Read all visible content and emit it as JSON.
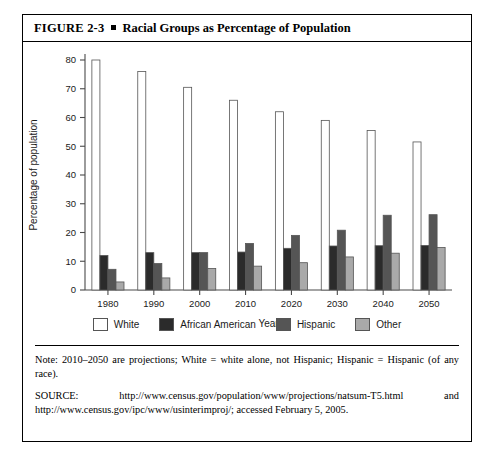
{
  "figure": {
    "number": "FIGURE 2-3",
    "title": "Racial Groups as Percentage of Population",
    "bullet_icon": "square-bullet-icon"
  },
  "chart_data": {
    "type": "bar",
    "title": "Racial Groups as Percentage of Population",
    "xlabel": "Year",
    "ylabel": "Percentage of population",
    "categories": [
      "1980",
      "1990",
      "2000",
      "2010",
      "2020",
      "2030",
      "2040",
      "2050"
    ],
    "ylim": [
      0,
      80
    ],
    "yticks": [
      0,
      10,
      20,
      30,
      40,
      50,
      60,
      70,
      80
    ],
    "grid": false,
    "legend_position": "bottom",
    "series": [
      {
        "name": "White",
        "color": "#ffffff",
        "values": [
          80.0,
          76.0,
          70.5,
          66.0,
          62.0,
          59.0,
          55.5,
          51.5
        ]
      },
      {
        "name": "African American",
        "color": "#2b2b2b",
        "values": [
          12.0,
          13.0,
          13.0,
          13.2,
          14.5,
          15.3,
          15.4,
          15.5
        ]
      },
      {
        "name": "Hispanic",
        "color": "#555555",
        "values": [
          7.2,
          9.2,
          13.0,
          16.2,
          19.0,
          20.8,
          26.0,
          26.2
        ]
      },
      {
        "name": "Other",
        "color": "#a9a9a9",
        "values": [
          2.8,
          4.2,
          7.5,
          8.3,
          9.5,
          11.5,
          12.8,
          14.8
        ]
      }
    ]
  },
  "notes": {
    "note_label": "Note:",
    "note_body": " 2010–2050 are projections; White = white alone, not Hispanic; Hispanic = Hispanic (of any race).",
    "source_label": "SOURCE:",
    "source_body": "  http://www.census.gov/population/www/projections/natsum-T5.html  and  http://www.census.gov/ipc/www/usinterimproj/; accessed February 5, 2005."
  }
}
